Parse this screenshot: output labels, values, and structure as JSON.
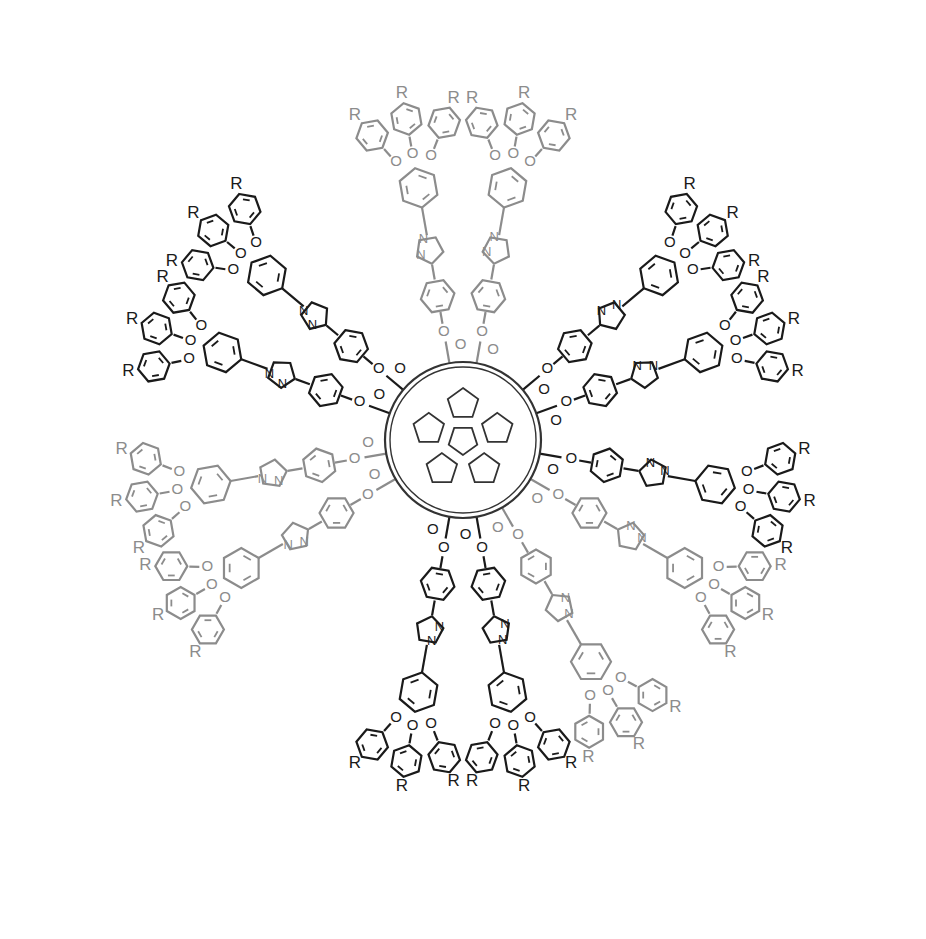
{
  "figure": {
    "core_label": "C60",
    "center": [
      463,
      440
    ],
    "core_radius": 78,
    "colors": {
      "dark": "#1a1a1a",
      "gray": "#8c8c8c",
      "background": "#ffffff"
    },
    "labels": {
      "substituent": "R",
      "oxygen": "O",
      "nitrogen": "N"
    },
    "arms": [
      {
        "angle": -100,
        "shade": "gray"
      },
      {
        "angle": -80,
        "shade": "gray"
      },
      {
        "angle": -40,
        "shade": "dark"
      },
      {
        "angle": -20,
        "shade": "dark"
      },
      {
        "angle": 10,
        "shade": "dark"
      },
      {
        "angle": 30,
        "shade": "gray"
      },
      {
        "angle": 60,
        "shade": "gray"
      },
      {
        "angle": 80,
        "shade": "dark"
      },
      {
        "angle": 100,
        "shade": "dark"
      },
      {
        "angle": 150,
        "shade": "gray"
      },
      {
        "angle": 170,
        "shade": "gray"
      },
      {
        "angle": -160,
        "shade": "dark"
      },
      {
        "angle": -140,
        "shade": "dark"
      }
    ]
  }
}
